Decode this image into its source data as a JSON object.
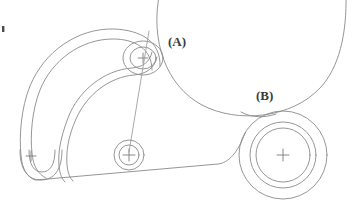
{
  "drawing": {
    "kind": "engineering-line-drawing",
    "background_color": "#ffffff",
    "line_color": "#8a8a8a",
    "label_color": "#3a3a3a",
    "labels": [
      {
        "id": "callout-a",
        "text": "(A)",
        "x": 168,
        "y": 45
      },
      {
        "id": "callout-b",
        "text": "(B)",
        "x": 256,
        "y": 100
      }
    ],
    "features": {
      "hook_arm_label": "curved hook arm",
      "upper_boss_label": "upper pivot boss",
      "center_boss_label": "center pivot boss",
      "right_boss_label": "right pivot boss",
      "lower_eye_label": "lower hook eye",
      "large_arc_label": "large reference circle",
      "bottom_edge_label": "lower body edge",
      "leader_line_label": "centre leader line",
      "edge_tick_label": "left edge tick mark"
    }
  }
}
